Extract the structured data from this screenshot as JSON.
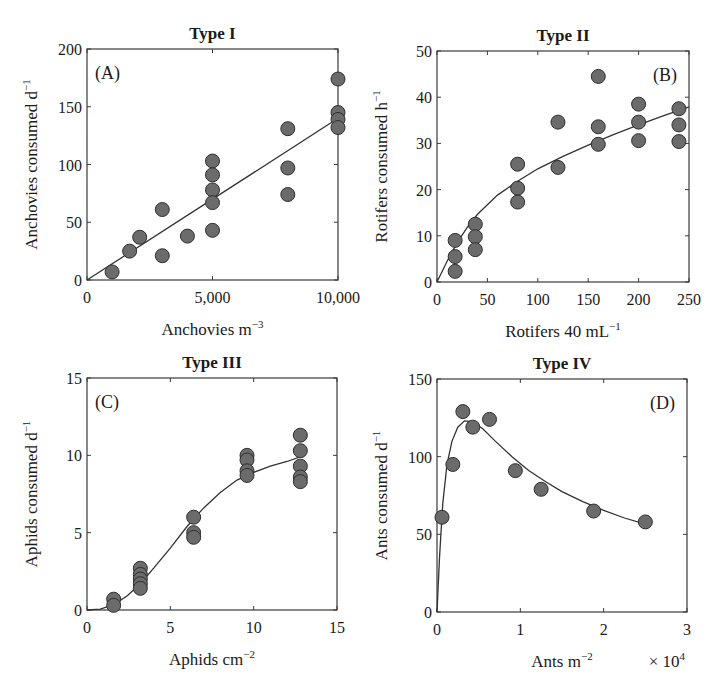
{
  "chart_data": [
    {
      "id": "A",
      "type": "scatter",
      "title": "Type I",
      "panel_label": "(A)",
      "panel_label_pos": "top-left",
      "xlabel": "Anchovies m",
      "xlabel_sup": "−3",
      "ylabel": "Anchovies consumed d",
      "ylabel_sup": "−1",
      "xlim": [
        0,
        10000
      ],
      "ylim": [
        0,
        200
      ],
      "xticks": [
        0,
        5000,
        10000
      ],
      "xtick_labels": [
        "0",
        "5,000",
        "10,000"
      ],
      "yticks": [
        0,
        50,
        100,
        150,
        200
      ],
      "ytick_labels": [
        "0",
        "50",
        "100",
        "150",
        "200"
      ],
      "grid": false,
      "points": [
        [
          1000,
          7
        ],
        [
          1700,
          25
        ],
        [
          2100,
          37
        ],
        [
          3000,
          61
        ],
        [
          3000,
          21
        ],
        [
          4000,
          38
        ],
        [
          5000,
          103
        ],
        [
          5000,
          91
        ],
        [
          5000,
          78
        ],
        [
          5000,
          67
        ],
        [
          5000,
          43
        ],
        [
          8000,
          131
        ],
        [
          8000,
          97
        ],
        [
          8000,
          74
        ],
        [
          10000,
          174
        ],
        [
          10000,
          145
        ],
        [
          10000,
          139
        ],
        [
          10000,
          132
        ]
      ],
      "fit": {
        "model": "linear",
        "curve": [
          [
            0,
            0
          ],
          [
            10000,
            140
          ]
        ]
      }
    },
    {
      "id": "B",
      "type": "scatter",
      "title": "Type II",
      "panel_label": "(B)",
      "panel_label_pos": "top-right",
      "xlabel": "Rotifers 40 mL",
      "xlabel_sup": "−1",
      "ylabel": "Rotifers consumed h",
      "ylabel_sup": "−1",
      "xlim": [
        0,
        250
      ],
      "ylim": [
        0,
        50
      ],
      "xticks": [
        0,
        50,
        100,
        150,
        200,
        250
      ],
      "xtick_labels": [
        "0",
        "50",
        "100",
        "150",
        "200",
        "250"
      ],
      "yticks": [
        0,
        10,
        20,
        30,
        40,
        50
      ],
      "ytick_labels": [
        "0",
        "10",
        "20",
        "30",
        "40",
        "50"
      ],
      "grid": false,
      "points": [
        [
          18,
          9
        ],
        [
          18,
          5.5
        ],
        [
          18,
          2.3
        ],
        [
          38,
          12.5
        ],
        [
          38,
          9.8
        ],
        [
          38,
          7
        ],
        [
          80,
          25.5
        ],
        [
          80,
          20.3
        ],
        [
          80,
          17.3
        ],
        [
          120,
          34.6
        ],
        [
          120,
          24.8
        ],
        [
          160,
          44.5
        ],
        [
          160,
          33.6
        ],
        [
          160,
          29.8
        ],
        [
          200,
          38.5
        ],
        [
          200,
          34.6
        ],
        [
          200,
          30.6
        ],
        [
          240,
          37.5
        ],
        [
          240,
          34
        ],
        [
          240,
          30.4
        ]
      ],
      "fit": {
        "model": "type II (saturating)",
        "curve": [
          [
            0,
            0
          ],
          [
            10,
            4.5
          ],
          [
            20,
            8.5
          ],
          [
            30,
            11.8
          ],
          [
            40,
            14.6
          ],
          [
            60,
            18.8
          ],
          [
            80,
            21.8
          ],
          [
            100,
            24.5
          ],
          [
            125,
            27.2
          ],
          [
            150,
            29.6
          ],
          [
            175,
            31.9
          ],
          [
            200,
            34
          ],
          [
            225,
            36
          ],
          [
            250,
            37.9
          ]
        ]
      }
    },
    {
      "id": "C",
      "type": "scatter",
      "title": "Type III",
      "panel_label": "(C)",
      "panel_label_pos": "top-left",
      "xlabel": "Aphids cm",
      "xlabel_sup": "−2",
      "ylabel": "Aphids consumed d",
      "ylabel_sup": "−1",
      "xlim": [
        0,
        15
      ],
      "ylim": [
        0,
        15
      ],
      "xticks": [
        0,
        5,
        10,
        15
      ],
      "xtick_labels": [
        "0",
        "5",
        "10",
        "15"
      ],
      "yticks": [
        0,
        5,
        10,
        15
      ],
      "ytick_labels": [
        "0",
        "5",
        "10",
        "15"
      ],
      "grid": false,
      "points": [
        [
          1.6,
          0.7
        ],
        [
          1.6,
          0.3
        ],
        [
          3.2,
          2.7
        ],
        [
          3.2,
          2.3
        ],
        [
          3.2,
          2.0
        ],
        [
          3.2,
          1.7
        ],
        [
          3.2,
          1.4
        ],
        [
          6.4,
          6.0
        ],
        [
          6.4,
          5.0
        ],
        [
          6.4,
          4.7
        ],
        [
          9.6,
          10.0
        ],
        [
          9.6,
          9.7
        ],
        [
          9.6,
          9.0
        ],
        [
          9.6,
          8.7
        ],
        [
          12.8,
          11.3
        ],
        [
          12.8,
          10.3
        ],
        [
          12.8,
          9.3
        ],
        [
          12.8,
          8.6
        ],
        [
          12.8,
          8.3
        ]
      ],
      "fit": {
        "model": "type III (sigmoid)",
        "curve": [
          [
            0,
            0
          ],
          [
            0.8,
            0.05
          ],
          [
            1.6,
            0.35
          ],
          [
            2.4,
            0.9
          ],
          [
            3.2,
            1.7
          ],
          [
            4,
            2.7
          ],
          [
            5,
            4.0
          ],
          [
            6,
            5.4
          ],
          [
            7,
            6.6
          ],
          [
            8,
            7.6
          ],
          [
            9,
            8.4
          ],
          [
            10,
            8.9
          ],
          [
            11,
            9.3
          ],
          [
            12,
            9.6
          ],
          [
            12.8,
            9.9
          ]
        ]
      }
    },
    {
      "id": "D",
      "type": "scatter",
      "title": "Type IV",
      "panel_label": "(D)",
      "panel_label_pos": "top-right",
      "xlabel": "Ants m",
      "xlabel_sup": "−2",
      "x_multiplier": "× 10",
      "x_multiplier_sup": "4",
      "ylabel": "Ants consumed d",
      "ylabel_sup": "−1",
      "xlim": [
        0,
        3
      ],
      "ylim": [
        0,
        150
      ],
      "xticks": [
        0,
        1,
        2,
        3
      ],
      "xtick_labels": [
        "0",
        "1",
        "2",
        "3"
      ],
      "yticks": [
        0,
        50,
        100,
        150
      ],
      "ytick_labels": [
        "0",
        "50",
        "100",
        "150"
      ],
      "grid": false,
      "points": [
        [
          0.06,
          61
        ],
        [
          0.19,
          95
        ],
        [
          0.31,
          129
        ],
        [
          0.43,
          119
        ],
        [
          0.63,
          124
        ],
        [
          0.94,
          91
        ],
        [
          1.25,
          79
        ],
        [
          1.88,
          65
        ],
        [
          2.5,
          58
        ]
      ],
      "fit": {
        "model": "type IV (dome-shaped)",
        "curve": [
          [
            0,
            0
          ],
          [
            0.03,
            35
          ],
          [
            0.07,
            70
          ],
          [
            0.12,
            95
          ],
          [
            0.18,
            110
          ],
          [
            0.25,
            119
          ],
          [
            0.33,
            123
          ],
          [
            0.42,
            122.5
          ],
          [
            0.55,
            118
          ],
          [
            0.7,
            110
          ],
          [
            0.9,
            100
          ],
          [
            1.1,
            91
          ],
          [
            1.3,
            84
          ],
          [
            1.5,
            77.5
          ],
          [
            1.75,
            71
          ],
          [
            2.0,
            65.5
          ],
          [
            2.25,
            60.5
          ],
          [
            2.5,
            56.5
          ]
        ]
      }
    }
  ],
  "style": {
    "marker_fill": "#6b6b6b",
    "marker_stroke": "#2e2e2e",
    "line_color": "#333333",
    "axis_color": "#3a3a3a",
    "text_color": "#1a1a1a"
  }
}
